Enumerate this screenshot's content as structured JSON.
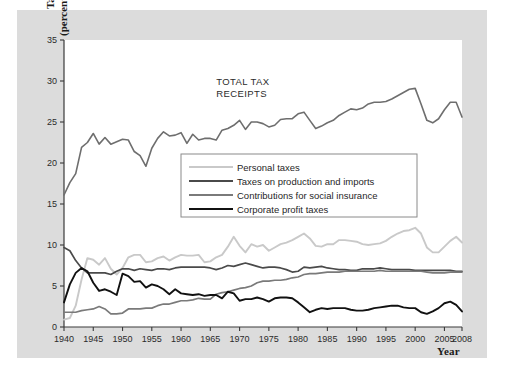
{
  "figure": {
    "background_color": "#dcdcdc",
    "plot_background_color": "#ffffff",
    "annotation_line1": "TOTAL TAX",
    "annotation_line2": "RECEIPTS",
    "ylabel_line1": "Taxes",
    "ylabel_line2": "(percent of GDP)",
    "xlabel": "Year"
  },
  "chart_data": {
    "type": "line",
    "title": "",
    "xlabel": "Year",
    "ylabel": "Taxes (percent of GDP)",
    "xlim": [
      1940,
      2008
    ],
    "ylim": [
      0,
      35
    ],
    "grid": false,
    "legend_position": "center",
    "xticks": [
      1940,
      1945,
      1950,
      1955,
      1960,
      1965,
      1970,
      1975,
      1980,
      1985,
      1990,
      1995,
      2000,
      2005,
      2008
    ],
    "yticks": [
      0,
      5,
      10,
      15,
      20,
      25,
      30,
      35
    ],
    "annotations": [
      {
        "text": "TOTAL TAX RECEIPTS",
        "x": 1966,
        "y": 29.5
      }
    ],
    "x": [
      1940,
      1941,
      1942,
      1943,
      1944,
      1945,
      1946,
      1947,
      1948,
      1949,
      1950,
      1951,
      1952,
      1953,
      1954,
      1955,
      1956,
      1957,
      1958,
      1959,
      1960,
      1961,
      1962,
      1963,
      1964,
      1965,
      1966,
      1967,
      1968,
      1969,
      1970,
      1971,
      1972,
      1973,
      1974,
      1975,
      1976,
      1977,
      1978,
      1979,
      1980,
      1981,
      1982,
      1983,
      1984,
      1985,
      1986,
      1987,
      1988,
      1989,
      1990,
      1991,
      1992,
      1993,
      1994,
      1995,
      1996,
      1997,
      1998,
      1999,
      2000,
      2001,
      2002,
      2003,
      2004,
      2005,
      2006,
      2007,
      2008
    ],
    "series": [
      {
        "name": "Total tax receipts",
        "color": "#6e6e6e",
        "width": 1.6,
        "labeled_in_legend": false,
        "values": [
          16.1,
          17.6,
          18.7,
          21.9,
          22.5,
          23.6,
          22.3,
          23.1,
          22.3,
          22.6,
          22.9,
          22.8,
          21.4,
          20.9,
          19.6,
          21.8,
          23.0,
          23.8,
          23.3,
          23.4,
          23.7,
          22.4,
          23.5,
          22.8,
          23.0,
          23.0,
          22.8,
          24.0,
          24.2,
          24.6,
          25.2,
          24.1,
          25.0,
          25.0,
          24.8,
          24.4,
          24.6,
          25.3,
          25.4,
          25.4,
          26.0,
          26.2,
          25.2,
          24.2,
          24.5,
          24.9,
          25.2,
          25.8,
          26.2,
          26.6,
          26.5,
          26.7,
          27.2,
          27.4,
          27.4,
          27.5,
          27.8,
          28.2,
          28.6,
          29.0,
          29.1,
          27.2,
          25.2,
          24.9,
          25.4,
          26.5,
          27.4,
          27.4,
          25.6
        ]
      },
      {
        "name": "Personal taxes",
        "color": "#c9c9c9",
        "width": 1.9,
        "labeled_in_legend": true,
        "values": [
          0.9,
          1.1,
          2.6,
          5.8,
          8.4,
          8.2,
          7.6,
          8.4,
          7.1,
          6.4,
          7.2,
          8.5,
          8.8,
          8.8,
          7.9,
          8.0,
          8.4,
          8.6,
          8.1,
          8.5,
          8.8,
          8.7,
          8.7,
          8.8,
          7.9,
          8.0,
          8.5,
          8.8,
          9.8,
          11.0,
          9.9,
          9.1,
          10.1,
          9.8,
          10.0,
          9.3,
          9.7,
          10.1,
          10.3,
          10.6,
          11.0,
          11.4,
          10.8,
          9.9,
          9.8,
          10.1,
          10.1,
          10.6,
          10.6,
          10.5,
          10.4,
          10.1,
          10.0,
          10.1,
          10.2,
          10.5,
          11.0,
          11.4,
          11.7,
          11.8,
          12.1,
          11.4,
          9.7,
          9.1,
          9.1,
          9.8,
          10.5,
          11.0,
          10.3
        ]
      },
      {
        "name": "Taxes on production and imports",
        "color": "#4a4a4a",
        "width": 1.7,
        "labeled_in_legend": true,
        "values": [
          9.7,
          9.3,
          8.1,
          7.2,
          6.6,
          6.6,
          6.6,
          6.6,
          6.4,
          6.8,
          7.1,
          7.1,
          6.9,
          7.1,
          7.0,
          6.9,
          7.1,
          7.1,
          7.0,
          7.2,
          7.3,
          7.3,
          7.3,
          7.3,
          7.3,
          7.2,
          7.0,
          7.2,
          7.5,
          7.4,
          7.6,
          7.8,
          7.6,
          7.4,
          7.2,
          7.3,
          7.3,
          7.2,
          7.0,
          6.7,
          6.8,
          7.3,
          7.2,
          7.3,
          7.4,
          7.2,
          7.1,
          7.0,
          7.0,
          6.9,
          6.9,
          7.1,
          7.1,
          7.1,
          7.2,
          7.1,
          7.0,
          7.0,
          7.0,
          7.0,
          6.9,
          6.9,
          6.9,
          6.9,
          6.9,
          6.9,
          6.9,
          6.8,
          6.8
        ]
      },
      {
        "name": "Contributions for social insurance",
        "color": "#7a7a7a",
        "width": 1.7,
        "labeled_in_legend": true,
        "values": [
          1.8,
          1.8,
          1.8,
          2.0,
          2.1,
          2.2,
          2.5,
          2.2,
          1.6,
          1.6,
          1.7,
          2.2,
          2.2,
          2.2,
          2.3,
          2.3,
          2.6,
          2.8,
          2.8,
          3.0,
          3.2,
          3.2,
          3.3,
          3.5,
          3.4,
          3.4,
          4.0,
          4.2,
          4.3,
          4.5,
          4.7,
          4.8,
          5.0,
          5.4,
          5.6,
          5.6,
          5.7,
          5.7,
          5.8,
          6.0,
          6.1,
          6.4,
          6.5,
          6.5,
          6.6,
          6.7,
          6.7,
          6.7,
          6.8,
          6.8,
          6.8,
          6.8,
          6.8,
          6.8,
          6.9,
          6.8,
          6.8,
          6.8,
          6.8,
          6.8,
          6.8,
          6.8,
          6.7,
          6.6,
          6.6,
          6.6,
          6.7,
          6.7,
          6.7
        ]
      },
      {
        "name": "Corporate profit taxes",
        "color": "#111111",
        "width": 1.9,
        "labeled_in_legend": true,
        "values": [
          3.0,
          5.2,
          6.6,
          7.2,
          6.8,
          5.4,
          4.4,
          4.6,
          4.3,
          3.9,
          6.5,
          6.2,
          5.5,
          5.6,
          4.8,
          5.2,
          5.0,
          4.6,
          4.0,
          4.6,
          4.1,
          4.0,
          3.9,
          4.0,
          3.8,
          3.9,
          3.9,
          3.5,
          4.3,
          4.1,
          3.2,
          3.4,
          3.4,
          3.6,
          3.4,
          3.1,
          3.5,
          3.6,
          3.6,
          3.5,
          3.0,
          2.4,
          1.8,
          2.1,
          2.3,
          2.2,
          2.3,
          2.3,
          2.3,
          2.1,
          2.0,
          2.0,
          2.1,
          2.3,
          2.4,
          2.5,
          2.6,
          2.6,
          2.4,
          2.3,
          2.3,
          1.8,
          1.6,
          1.9,
          2.3,
          2.9,
          3.1,
          2.7,
          1.9
        ]
      }
    ],
    "legend": [
      {
        "label": "Personal taxes",
        "color": "#c9c9c9"
      },
      {
        "label": "Taxes on production and imports",
        "color": "#4a4a4a"
      },
      {
        "label": "Contributions for social insurance",
        "color": "#7a7a7a"
      },
      {
        "label": "Corporate profit taxes",
        "color": "#111111"
      }
    ]
  }
}
